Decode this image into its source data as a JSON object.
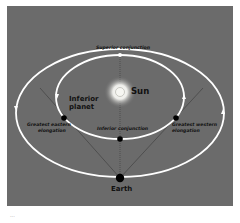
{
  "diagram": {
    "colors": {
      "background": "#6b6b6b",
      "orbit": "#ffffff",
      "sight_line": "#3a3a3a",
      "planet": "#000000",
      "text": "#111111"
    },
    "labels": {
      "sun": "Sun",
      "earth": "Earth",
      "inferior_planet": "Inferior planet",
      "inferior_planet_line1": "Inferior",
      "inferior_planet_line2": "planet",
      "superior_conjunction": "Superior conjunction",
      "inferior_conjunction": "Inferior conjunction",
      "greatest_eastern_line1": "Greatest eastern",
      "greatest_eastern_line2": "elongation",
      "greatest_western_line1": "Greatest western",
      "greatest_western_line2": "elongation"
    },
    "caption": "..."
  }
}
